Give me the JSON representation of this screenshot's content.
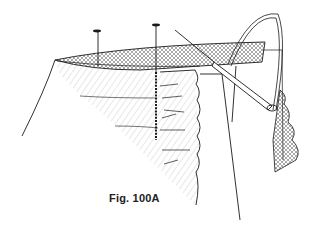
{
  "figure": {
    "caption": "Fig. 100A",
    "colors": {
      "ink": "#1a1a1a",
      "hatch": "#555555",
      "background": "#ffffff"
    },
    "elements": [
      {
        "name": "pin-left",
        "label": "pin"
      },
      {
        "name": "pin-center",
        "label": "pin"
      },
      {
        "name": "fabric-band",
        "label": "band / hem edge"
      },
      {
        "name": "gathered-ruffle",
        "label": "gathered fabric"
      },
      {
        "name": "stitch-line",
        "label": "basting stitches"
      },
      {
        "name": "needle",
        "label": "needle"
      },
      {
        "name": "thread",
        "label": "thread"
      }
    ]
  }
}
